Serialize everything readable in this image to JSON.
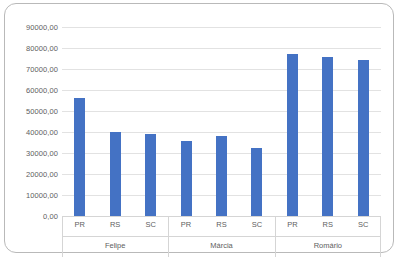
{
  "chart_data": {
    "type": "bar",
    "title": "",
    "subtitle": "",
    "xlabel": "",
    "ylabel": "",
    "grid": true,
    "legend": false,
    "legend_position": "none",
    "ylim": [
      0,
      90000
    ],
    "y_tick_labels": [
      "90000,00",
      "80000,00",
      "70000,00",
      "60000,00",
      "50000,00",
      "40000,00",
      "30000,00",
      "20000,00",
      "10000,00",
      "0,00"
    ],
    "y_tick_values": [
      90000,
      80000,
      70000,
      60000,
      50000,
      40000,
      30000,
      20000,
      10000,
      0
    ],
    "groups": [
      {
        "label": "Felipe",
        "categories": [
          "PR",
          "RS",
          "SC"
        ],
        "values": [
          56000,
          40200,
          39200
        ]
      },
      {
        "label": "Márcia",
        "categories": [
          "PR",
          "RS",
          "SC"
        ],
        "values": [
          35800,
          38200,
          32200
        ]
      },
      {
        "label": "Romário",
        "categories": [
          "PR",
          "RS",
          "SC"
        ],
        "values": [
          77000,
          75500,
          74500
        ]
      }
    ],
    "categories": [
      "PR",
      "RS",
      "SC"
    ],
    "bar_color": "#4472C4",
    "gridline_color": "#E2E2E2",
    "axis_text_color": "#5E5E5E",
    "frame_color": "#B9B9B9"
  }
}
